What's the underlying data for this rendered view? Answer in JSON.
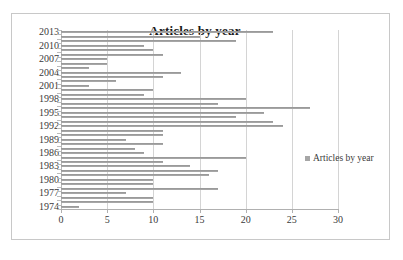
{
  "chart_data": {
    "type": "bar",
    "orientation": "horizontal",
    "title": "Articles by year",
    "xlabel": "",
    "ylabel": "",
    "xlim": [
      0,
      30
    ],
    "xticks": [
      0,
      5,
      10,
      15,
      20,
      25,
      30
    ],
    "xtick_labels": [
      "0",
      "5",
      "10",
      "15",
      "20",
      "25",
      "30"
    ],
    "grid": true,
    "grid_axis": "x",
    "legend": {
      "position": "right",
      "entries": [
        "Articles by year"
      ]
    },
    "series": [
      {
        "name": "Articles by year",
        "color": "#a6a6a6"
      }
    ],
    "categories": [
      "2013",
      "2012",
      "2011",
      "2010",
      "2009",
      "2008",
      "2007",
      "2006",
      "2005",
      "2004",
      "2003",
      "2002",
      "2001",
      "2000",
      "1999",
      "1998",
      "1997",
      "1996",
      "1995",
      "1994",
      "1993",
      "1992",
      "1991",
      "1990",
      "1989",
      "1988",
      "1987",
      "1986",
      "1985",
      "1984",
      "1983",
      "1982",
      "1981",
      "1980",
      "1979",
      "1978",
      "1977",
      "1976",
      "1975",
      "1974"
    ],
    "values": [
      23,
      15,
      19,
      9,
      10,
      11,
      5,
      5,
      3,
      13,
      11,
      6,
      3,
      10,
      9,
      20,
      17,
      27,
      22,
      19,
      23,
      24,
      11,
      11,
      7,
      11,
      8,
      9,
      20,
      11,
      14,
      17,
      16,
      10,
      10,
      17,
      7,
      10,
      10,
      2
    ],
    "ytick_labels": [
      "2013",
      "2010",
      "2007",
      "2004",
      "2001",
      "1998",
      "1995",
      "1992",
      "1989",
      "1986",
      "1983",
      "1980",
      "1977",
      "1974"
    ],
    "ytick_category_indices": [
      0,
      3,
      6,
      9,
      12,
      15,
      18,
      21,
      24,
      27,
      30,
      33,
      36,
      39
    ]
  }
}
